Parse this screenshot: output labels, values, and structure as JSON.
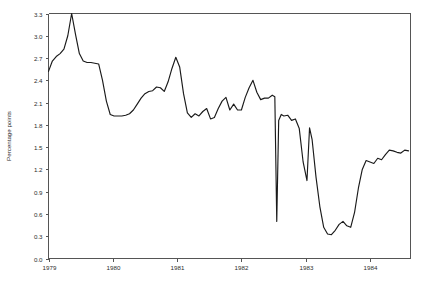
{
  "chart_data": {
    "type": "line",
    "title": "",
    "xlabel": "",
    "ylabel": "Percentage points",
    "xlim": [
      1979.0,
      1984.63
    ],
    "ylim": [
      0.0,
      3.3
    ],
    "grid": false,
    "legend": false,
    "x_ticks": [
      1979,
      1980,
      1981,
      1982,
      1983,
      1984
    ],
    "x_tick_labels": [
      "1979",
      "1980",
      "1981",
      "1982",
      "1983",
      "1984"
    ],
    "y_ticks": [
      0.0,
      0.3,
      0.6,
      0.9,
      1.2,
      1.5,
      1.8,
      2.1,
      2.4,
      2.7,
      3.0,
      3.3
    ],
    "y_tick_labels": [
      "0.0",
      "0.3",
      "0.6",
      "0.9",
      "1.2",
      "1.5",
      "1.8",
      "2.1",
      "2.4",
      "2.7",
      "3.0",
      "3.3"
    ],
    "series": [
      {
        "name": "Interest rate spread",
        "color": "#1a1a1a",
        "x": [
          1979.0,
          1979.06,
          1979.12,
          1979.18,
          1979.24,
          1979.3,
          1979.36,
          1979.42,
          1979.48,
          1979.54,
          1979.6,
          1979.66,
          1979.72,
          1979.78,
          1979.84,
          1979.9,
          1979.96,
          1980.02,
          1980.08,
          1980.14,
          1980.2,
          1980.26,
          1980.32,
          1980.38,
          1980.44,
          1980.5,
          1980.56,
          1980.62,
          1980.68,
          1980.74,
          1980.8,
          1980.86,
          1980.92,
          1980.98,
          1981.04,
          1981.1,
          1981.16,
          1981.22,
          1981.28,
          1981.34,
          1981.4,
          1981.46,
          1981.52,
          1981.58,
          1981.64,
          1981.7,
          1981.76,
          1981.82,
          1981.88,
          1981.94,
          1982.0,
          1982.06,
          1982.12,
          1982.18,
          1982.24,
          1982.3,
          1982.36,
          1982.42,
          1982.48,
          1982.52,
          1982.55,
          1982.58,
          1982.62,
          1982.66,
          1982.72,
          1982.78,
          1982.84,
          1982.9,
          1982.96,
          1983.02,
          1983.06,
          1983.1,
          1983.16,
          1983.22,
          1983.28,
          1983.34,
          1983.4,
          1983.46,
          1983.52,
          1983.58,
          1983.64,
          1983.7,
          1983.76,
          1983.82,
          1983.88,
          1983.94,
          1984.0,
          1984.06,
          1984.12,
          1984.18,
          1984.24,
          1984.3,
          1984.36,
          1984.42,
          1984.48,
          1984.54,
          1984.6
        ],
        "y": [
          2.52,
          2.66,
          2.72,
          2.76,
          2.82,
          3.0,
          3.3,
          3.02,
          2.76,
          2.66,
          2.64,
          2.64,
          2.63,
          2.62,
          2.4,
          2.12,
          1.94,
          1.92,
          1.92,
          1.92,
          1.93,
          1.95,
          2.0,
          2.08,
          2.16,
          2.22,
          2.25,
          2.26,
          2.31,
          2.3,
          2.25,
          2.38,
          2.56,
          2.71,
          2.58,
          2.22,
          1.96,
          1.9,
          1.95,
          1.92,
          1.98,
          2.02,
          1.88,
          1.9,
          2.02,
          2.12,
          2.17,
          2.0,
          2.08,
          2.0,
          2.0,
          2.17,
          2.3,
          2.4,
          2.24,
          2.14,
          2.16,
          2.16,
          2.2,
          2.18,
          0.5,
          1.86,
          1.94,
          1.92,
          1.93,
          1.86,
          1.88,
          1.75,
          1.3,
          1.05,
          1.76,
          1.6,
          1.1,
          0.7,
          0.42,
          0.33,
          0.32,
          0.38,
          0.46,
          0.5,
          0.44,
          0.42,
          0.62,
          0.95,
          1.2,
          1.32,
          1.3,
          1.28,
          1.35,
          1.33,
          1.4,
          1.46,
          1.45,
          1.43,
          1.42,
          1.46,
          1.45
        ]
      }
    ]
  },
  "axes": {
    "y_axis_title": "Percentage points"
  }
}
